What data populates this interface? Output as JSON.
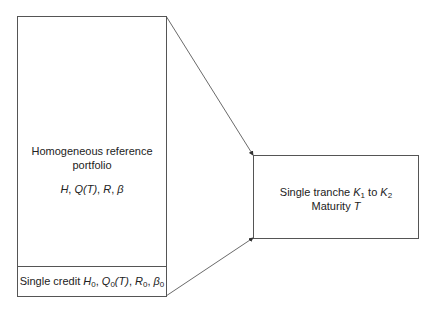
{
  "portfolio_box": {
    "line1": "Homogeneous reference",
    "line2": "portfolio",
    "params": [
      "H",
      "Q(T)",
      "R",
      "β"
    ]
  },
  "single_credit_box": {
    "label": "Single credit",
    "params": [
      {
        "sym": "H",
        "sub": "0"
      },
      {
        "sym": "Q",
        "sub": "0",
        "arg": "(T)"
      },
      {
        "sym": "R",
        "sub": "0"
      },
      {
        "sym": "β",
        "sub": "0"
      }
    ]
  },
  "tranche_box": {
    "line1_prefix": "Single tranche",
    "k1": {
      "sym": "K",
      "sub": "1"
    },
    "to": "to",
    "k2": {
      "sym": "K",
      "sub": "2"
    },
    "line2_prefix": "Maturity",
    "maturity_sym": "T"
  }
}
